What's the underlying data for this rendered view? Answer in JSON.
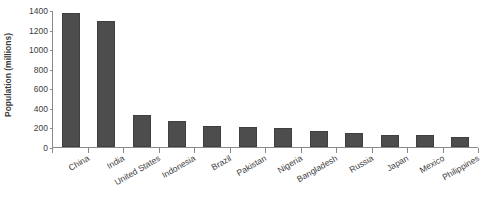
{
  "chart_data": {
    "type": "bar",
    "title": "",
    "subtitle": "",
    "xlabel": "",
    "ylabel": "Population (millions)",
    "categories": [
      "China",
      "India",
      "United States",
      "Indonesia",
      "Brazil",
      "Pakistan",
      "Nigeria",
      "Bangladesh",
      "Russia",
      "Japan",
      "Mexico",
      "Philippines"
    ],
    "values": [
      1370,
      1285,
      330,
      265,
      210,
      200,
      195,
      165,
      145,
      127,
      125,
      105
    ],
    "ylim": [
      0,
      1400
    ],
    "ytick_labels": [
      "0",
      "200",
      "400",
      "600",
      "800",
      "1000",
      "1200",
      "1400"
    ],
    "ytick_values": [
      0,
      200,
      400,
      600,
      800,
      1000,
      1200,
      1400
    ],
    "grid": false,
    "legend": null,
    "legend_position": "none",
    "series": [
      {
        "name": "Population (millions)",
        "values": [
          1370,
          1285,
          330,
          265,
          210,
          200,
          195,
          165,
          145,
          127,
          125,
          105
        ]
      }
    ]
  },
  "style": {
    "bar_color": "#4d4d4d",
    "bar_border_color": "#3f3f3f",
    "axis_color": "#8a8a8a",
    "text_color": "#3c3c3c",
    "background": "#ffffff"
  }
}
